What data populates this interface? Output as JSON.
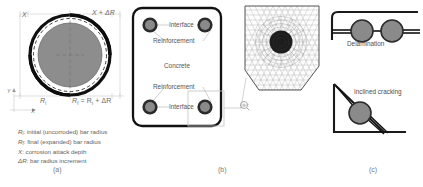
{
  "figure": {
    "background_color": "#ffffff",
    "panels": [
      {
        "id": "a",
        "label": "(a)"
      },
      {
        "id": "b",
        "label": "(b)"
      },
      {
        "id": "c",
        "label": "(c)"
      }
    ]
  },
  "panel_a": {
    "title_label": "(a)",
    "dimension_top_left": "X",
    "dimension_top_right": "X + ΔR",
    "dimension_bottom_left": "R",
    "dimension_bottom_left_sub": "i",
    "dimension_bottom_right_main": "R",
    "dimension_bottom_right_sub": "f",
    "dimension_bottom_right_rest": " = R",
    "dimension_bottom_right_sub2": "i",
    "dimension_bottom_right_tail": " + ΔR",
    "axis_y_label": "Y",
    "axis_x_label": "X",
    "legend": [
      {
        "symbol": "R",
        "sub": "i",
        "text": ": initial (uncorroded) bar radius"
      },
      {
        "symbol": "R",
        "sub": "f",
        "text": ": final (expanded) bar radius"
      },
      {
        "symbol": "X",
        "sub": "",
        "text": ": corrosion attack depth"
      },
      {
        "symbol": "ΔR",
        "sub": "",
        "text": ": bar radius increment"
      }
    ],
    "colors": {
      "core_fill": "#8d8d8d",
      "core_stroke": "#6e6e6e",
      "outer_ring": "#111111",
      "dashed_ring": "#222222",
      "dimension_line": "#b5b5b5"
    }
  },
  "panel_b": {
    "title_label": "(b)",
    "annotations": [
      {
        "name": "interface-top",
        "text": "Interface"
      },
      {
        "name": "reinforcement-top",
        "text": "Reinforcement"
      },
      {
        "name": "concrete",
        "text": "Concrete"
      },
      {
        "name": "reinforcement-bottom",
        "text": "Reinforcement"
      },
      {
        "name": "interface-bottom",
        "text": "Interface"
      }
    ],
    "rebar_count": 4,
    "mesh": {
      "name": "finite-element-mesh",
      "description_visible": false
    },
    "colors": {
      "specimen_outline": "#111111",
      "rebar_ring": "#2a2a2a",
      "rebar_core": "#8a8a8a",
      "leader": "#a9a9a9",
      "detail_box": "#c2c2c2",
      "mesh_line": "#8e8e8e",
      "mesh_rebar": "#1d1d1d"
    }
  },
  "panel_c": {
    "title_label": "(c)",
    "annotations": [
      {
        "name": "delamination",
        "text": "Delamination"
      },
      {
        "name": "inclined-cracking",
        "text": "Inclined cracking"
      }
    ],
    "colors": {
      "outline": "#1a1a1a",
      "rebar_fill": "#8a8a8a",
      "rebar_stroke": "#2b2b2b",
      "crack": "#111111"
    }
  }
}
